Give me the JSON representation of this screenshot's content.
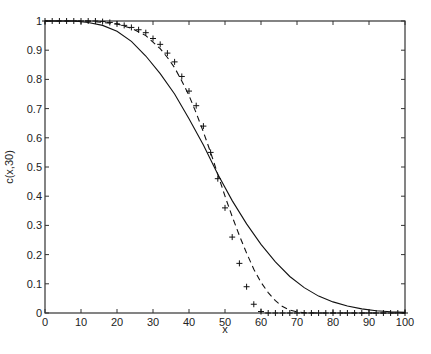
{
  "chart_data": {
    "type": "line",
    "title": "",
    "xlabel": "x",
    "ylabel": "c(x,30)",
    "xlim": [
      0,
      100
    ],
    "ylim": [
      0,
      1
    ],
    "xticks": [
      0,
      10,
      20,
      30,
      40,
      50,
      60,
      70,
      80,
      90,
      100
    ],
    "yticks": [
      0,
      0.1,
      0.2,
      0.3,
      0.4,
      0.5,
      0.6,
      0.7,
      0.8,
      0.9,
      1
    ],
    "xtick_labels": [
      "0",
      "10",
      "20",
      "30",
      "40",
      "50",
      "60",
      "70",
      "80",
      "90",
      "100"
    ],
    "ytick_labels": [
      "0",
      "0.1",
      "0.2",
      "0.3",
      "0.4",
      "0.5",
      "0.6",
      "0.7",
      "0.8",
      "0.9",
      "1"
    ],
    "grid": false,
    "legend": null,
    "series": [
      {
        "name": "solid",
        "style": "solid",
        "x": [
          0,
          4,
          8,
          12,
          16,
          20,
          24,
          28,
          32,
          36,
          40,
          44,
          48,
          52,
          56,
          60,
          64,
          68,
          72,
          76,
          80,
          84,
          88,
          92,
          96,
          100
        ],
        "y": [
          1.0,
          1.0,
          1.0,
          0.995,
          0.985,
          0.965,
          0.93,
          0.88,
          0.82,
          0.75,
          0.665,
          0.575,
          0.475,
          0.385,
          0.305,
          0.235,
          0.175,
          0.125,
          0.087,
          0.058,
          0.038,
          0.024,
          0.014,
          0.008,
          0.004,
          0.002
        ]
      },
      {
        "name": "dashed",
        "style": "dashed",
        "x": [
          0,
          4,
          8,
          12,
          16,
          20,
          24,
          28,
          32,
          34,
          36,
          38,
          40,
          42,
          44,
          46,
          48,
          50,
          52,
          54,
          56,
          58,
          60,
          62,
          64,
          66,
          68,
          70,
          72,
          76,
          80,
          90,
          100
        ],
        "y": [
          1.0,
          1.0,
          1.0,
          1.0,
          0.995,
          0.99,
          0.975,
          0.95,
          0.905,
          0.875,
          0.84,
          0.795,
          0.745,
          0.685,
          0.62,
          0.55,
          0.475,
          0.4,
          0.33,
          0.265,
          0.205,
          0.15,
          0.105,
          0.07,
          0.042,
          0.022,
          0.01,
          0.004,
          0.001,
          0,
          0,
          0,
          0
        ]
      },
      {
        "name": "plus-markers",
        "style": "marker-plus",
        "x": [
          0,
          2,
          4,
          6,
          8,
          10,
          12,
          14,
          16,
          18,
          20,
          22,
          24,
          26,
          28,
          30,
          32,
          34,
          36,
          38,
          40,
          42,
          44,
          46,
          48,
          50,
          52,
          54,
          56,
          58,
          60,
          62,
          64,
          66,
          68,
          70,
          72,
          74,
          76,
          78,
          80,
          82,
          84,
          86,
          88,
          90,
          92,
          94,
          96,
          98,
          100
        ],
        "y": [
          1,
          1,
          1,
          1,
          1,
          1,
          1,
          1,
          0.998,
          0.995,
          0.99,
          0.985,
          0.978,
          0.97,
          0.96,
          0.94,
          0.92,
          0.89,
          0.86,
          0.81,
          0.76,
          0.71,
          0.64,
          0.55,
          0.46,
          0.36,
          0.26,
          0.17,
          0.09,
          0.03,
          0.005,
          0,
          0,
          0,
          0,
          0,
          0,
          0,
          0,
          0,
          0,
          0,
          0,
          0,
          0,
          0,
          0,
          0,
          0,
          0,
          0
        ]
      }
    ]
  },
  "plot": {
    "ylabel": "c(x,30)",
    "xlabel": "x"
  }
}
